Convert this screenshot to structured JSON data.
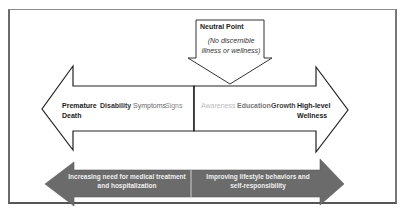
{
  "neutral_point": {
    "title": "Neutral Point",
    "subtitle": "(No discernible illness or wellness)"
  },
  "illness_side": {
    "labels": [
      {
        "text": "Premature",
        "color": "#1a1a1a"
      },
      {
        "text": "Death",
        "color": "#1a1a1a"
      },
      {
        "text": "Disability",
        "color": "#333333"
      },
      {
        "text": "Symptoms",
        "color": "#666666"
      },
      {
        "text": "Signs",
        "color": "#888888"
      }
    ]
  },
  "wellness_side": {
    "labels": [
      {
        "text": "Awareness",
        "color": "#bbbbbb"
      },
      {
        "text": "Education",
        "color": "#777777"
      },
      {
        "text": "Growth",
        "color": "#444444"
      },
      {
        "text": "High-level",
        "color": "#1a1a1a"
      },
      {
        "text": "Wellness",
        "color": "#1a1a1a"
      }
    ]
  },
  "bottom_arrow": {
    "left_text_line1": "Increasing need for medical treatment",
    "left_text_line2": "and hospitalization",
    "right_text_line1": "Improving lifestyle behaviors and",
    "right_text_line2": "self-responsibility",
    "fill_color": "#6b6b6b"
  }
}
